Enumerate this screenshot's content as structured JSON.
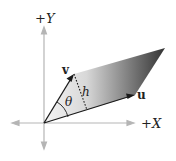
{
  "diagram": {
    "axes": {
      "x_label": "+X",
      "y_label": "+Y"
    },
    "vectors": {
      "u": {
        "label": "u"
      },
      "v": {
        "label": "v"
      }
    },
    "angle_label": "θ",
    "height_label": "h",
    "colors": {
      "axis": "#b0b0b0",
      "vector": "#1a1a1a",
      "fill_dark": "#3a3a3a",
      "fill_light": "#f2f2f2"
    }
  }
}
